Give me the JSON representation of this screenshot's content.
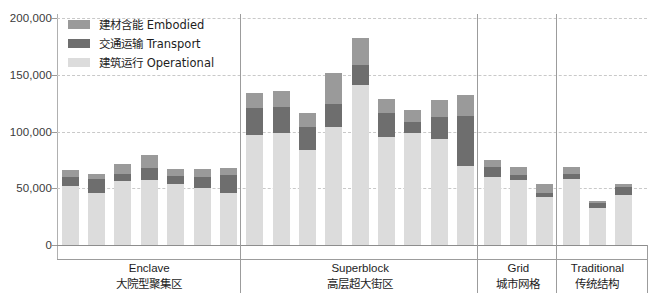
{
  "chart_data": {
    "type": "bar",
    "stacked": true,
    "title": "",
    "xlabel": "",
    "ylabel": "",
    "ylim": [
      0,
      200000
    ],
    "yticks": [
      0,
      50000,
      100000,
      150000,
      200000
    ],
    "ytick_labels": [
      "0",
      "50,000",
      "100,000",
      "150,000",
      "200,000"
    ],
    "grid": true,
    "legend_position": "top-left",
    "series": [
      {
        "name": "建材含能 Embodied",
        "key": "embodied",
        "color": "#9a9a9a"
      },
      {
        "name": "交通运输 Transport",
        "key": "transport",
        "color": "#6e6e6e"
      },
      {
        "name": "建筑运行 Operational",
        "key": "operational",
        "color": "#dcdcdc"
      }
    ],
    "groups": [
      {
        "label_en": "Enclave",
        "label_zh": "大院型聚集区",
        "bars": [
          {
            "operational": 52000,
            "transport": 8000,
            "embodied": 6000
          },
          {
            "operational": 46000,
            "transport": 12000,
            "embodied": 5000
          },
          {
            "operational": 56000,
            "transport": 7000,
            "embodied": 8000
          },
          {
            "operational": 57000,
            "transport": 11000,
            "embodied": 11000
          },
          {
            "operational": 54000,
            "transport": 7000,
            "embodied": 6000
          },
          {
            "operational": 50000,
            "transport": 10000,
            "embodied": 7000
          },
          {
            "operational": 46000,
            "transport": 16000,
            "embodied": 6000
          }
        ]
      },
      {
        "label_en": "Superblock",
        "label_zh": "高层超大街区",
        "bars": [
          {
            "operational": 97000,
            "transport": 24000,
            "embodied": 13000
          },
          {
            "operational": 99000,
            "transport": 23000,
            "embodied": 14000
          },
          {
            "operational": 84000,
            "transport": 20000,
            "embodied": 12000
          },
          {
            "operational": 104000,
            "transport": 20000,
            "embodied": 28000
          },
          {
            "operational": 141000,
            "transport": 18000,
            "embodied": 23000
          },
          {
            "operational": 95000,
            "transport": 21000,
            "embodied": 13000
          },
          {
            "operational": 99000,
            "transport": 9000,
            "embodied": 11000
          },
          {
            "operational": 93000,
            "transport": 20000,
            "embodied": 15000
          },
          {
            "operational": 70000,
            "transport": 44000,
            "embodied": 18000
          }
        ]
      },
      {
        "label_en": "Grid",
        "label_zh": "城市网格",
        "bars": [
          {
            "operational": 60000,
            "transport": 9000,
            "embodied": 6000
          },
          {
            "operational": 57000,
            "transport": 5000,
            "embodied": 7000
          },
          {
            "operational": 42000,
            "transport": 4000,
            "embodied": 8000
          }
        ]
      },
      {
        "label_en": "Traditional",
        "label_zh": "传统结构",
        "bars": [
          {
            "operational": 58000,
            "transport": 5000,
            "embodied": 6000
          },
          {
            "operational": 33000,
            "transport": 4000,
            "embodied": 2000
          },
          {
            "operational": 44000,
            "transport": 7000,
            "embodied": 3000
          }
        ]
      }
    ]
  }
}
